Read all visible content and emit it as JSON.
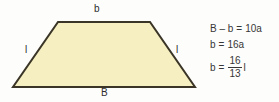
{
  "figure": {
    "background_color": "#fdfdfb",
    "shape": {
      "name": "trapezoid",
      "fill_color": "#f6efc2",
      "stroke_color": "#3a3526",
      "stroke_width": 2,
      "vertices": [
        {
          "x": 58,
          "y": 22
        },
        {
          "x": 150,
          "y": 22
        },
        {
          "x": 195,
          "y": 87
        },
        {
          "x": 13,
          "y": 87
        }
      ]
    },
    "labels": {
      "top_base": "b",
      "bottom_base": "B",
      "left_side": "l",
      "right_side": "l"
    }
  },
  "equations": {
    "line1": {
      "lhs": "B – b",
      "eq": "=",
      "rhs": "10a"
    },
    "line2": {
      "lhs": "b",
      "eq": "=",
      "rhs": "16a"
    },
    "line3": {
      "lhs": "b",
      "eq": "=",
      "numerator": "16",
      "denominator": "13",
      "tail": "l"
    }
  }
}
